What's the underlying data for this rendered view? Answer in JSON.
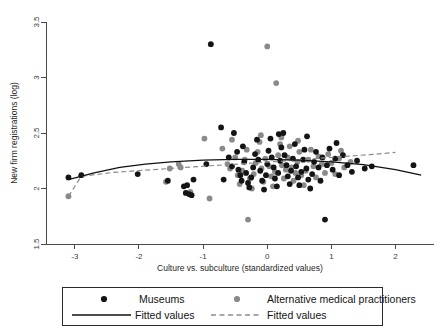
{
  "chart_data": {
    "type": "scatter",
    "title": "",
    "xlabel": "Culture vs. subculture (standardized values)",
    "ylabel": "New firm registrations (log)",
    "xlim": [
      -3.45,
      2.6
    ],
    "ylim": [
      1.5,
      3.5
    ],
    "xticks": [
      -3,
      -2,
      -1,
      0,
      1,
      2
    ],
    "xticklabels": [
      "-3",
      "-2",
      "-1",
      "0",
      "1",
      "2"
    ],
    "yticks": [
      1.5,
      2,
      2.5,
      3,
      3.5
    ],
    "yticklabels": [
      "1.5",
      "2",
      "2.5",
      "3",
      "3.5"
    ],
    "grid": false,
    "legend_position": "below-axes",
    "colors": {
      "museums": "#141414",
      "practitioners": "#8a8a8a",
      "fit_museums": "#111111",
      "fit_practitioners": "#8c8c8c",
      "axis": "#4a4a4a",
      "background": "#ffffff"
    },
    "series": [
      {
        "name": "Museums",
        "marker": "circle",
        "color": "#141414",
        "points": [
          [
            -3.1,
            2.1
          ],
          [
            -2.9,
            2.12
          ],
          [
            -2.02,
            2.13
          ],
          [
            -1.3,
            2.02
          ],
          [
            -1.25,
            2.03
          ],
          [
            -1.27,
            1.96
          ],
          [
            -1.22,
            1.95
          ],
          [
            -1.18,
            1.94
          ],
          [
            -1.15,
            2.08
          ],
          [
            -0.95,
            2.22
          ],
          [
            -0.88,
            3.3
          ],
          [
            -0.72,
            2.55
          ],
          [
            -0.6,
            2.28
          ],
          [
            -0.55,
            2.2
          ],
          [
            -0.52,
            2.5
          ],
          [
            -0.47,
            2.33
          ],
          [
            -0.45,
            2.17
          ],
          [
            -0.42,
            2.12
          ],
          [
            -0.4,
            2.07
          ],
          [
            -0.38,
            2.38
          ],
          [
            -0.36,
            2.24
          ],
          [
            -0.33,
            2.14
          ],
          [
            -0.3,
            2.05
          ],
          [
            -0.28,
            2.01
          ],
          [
            -0.25,
            2.1
          ],
          [
            -0.22,
            2.19
          ],
          [
            -0.19,
            2.31
          ],
          [
            -0.16,
            2.44
          ],
          [
            -0.14,
            2.26
          ],
          [
            -0.11,
            2.16
          ],
          [
            -0.08,
            2.07
          ],
          [
            -0.05,
            1.99
          ],
          [
            -0.02,
            2.12
          ],
          [
            0.0,
            2.22
          ],
          [
            0.02,
            2.34
          ],
          [
            0.05,
            2.45
          ],
          [
            0.07,
            2.28
          ],
          [
            0.1,
            2.19
          ],
          [
            0.12,
            2.09
          ],
          [
            0.15,
            2.02
          ],
          [
            0.17,
            2.14
          ],
          [
            0.2,
            2.25
          ],
          [
            0.22,
            2.37
          ],
          [
            0.25,
            2.5
          ],
          [
            0.27,
            2.3
          ],
          [
            0.3,
            2.21
          ],
          [
            0.32,
            2.11
          ],
          [
            0.35,
            2.04
          ],
          [
            0.37,
            2.16
          ],
          [
            0.4,
            2.27
          ],
          [
            0.43,
            2.4
          ],
          [
            0.45,
            2.2
          ],
          [
            0.48,
            2.1
          ],
          [
            0.5,
            2.03
          ],
          [
            0.53,
            2.15
          ],
          [
            0.56,
            2.26
          ],
          [
            0.58,
            2.35
          ],
          [
            0.61,
            2.18
          ],
          [
            0.64,
            2.08
          ],
          [
            0.67,
            2.0
          ],
          [
            0.7,
            2.13
          ],
          [
            0.73,
            2.24
          ],
          [
            0.76,
            2.33
          ],
          [
            0.8,
            2.19
          ],
          [
            0.83,
            2.07
          ],
          [
            0.86,
            2.28
          ],
          [
            0.9,
            1.72
          ],
          [
            0.93,
            2.21
          ],
          [
            0.97,
            2.36
          ],
          [
            1.02,
            2.17
          ],
          [
            1.06,
            2.27
          ],
          [
            1.12,
            2.12
          ],
          [
            1.18,
            2.3
          ],
          [
            1.25,
            2.21
          ],
          [
            1.32,
            2.15
          ],
          [
            1.4,
            2.25
          ],
          [
            1.52,
            2.18
          ],
          [
            1.63,
            2.2
          ],
          [
            2.28,
            2.21
          ],
          [
            -1.55,
            2.07
          ],
          [
            -0.68,
            2.08
          ],
          [
            0.18,
            2.49
          ],
          [
            0.62,
            2.47
          ],
          [
            1.08,
            2.41
          ]
        ]
      },
      {
        "name": "Alternative medical practitioners",
        "marker": "circle",
        "color": "#8a8a8a",
        "points": [
          [
            -3.1,
            1.93
          ],
          [
            -1.58,
            2.06
          ],
          [
            -1.52,
            2.18
          ],
          [
            -1.38,
            2.22
          ],
          [
            -1.35,
            2.19
          ],
          [
            -1.2,
            1.97
          ],
          [
            -0.98,
            2.45
          ],
          [
            -0.9,
            1.91
          ],
          [
            -0.62,
            2.22
          ],
          [
            -0.58,
            2.18
          ],
          [
            -0.5,
            2.28
          ],
          [
            -0.46,
            2.12
          ],
          [
            -0.43,
            2.04
          ],
          [
            -0.39,
            2.16
          ],
          [
            -0.35,
            2.26
          ],
          [
            -0.32,
            2.35
          ],
          [
            -0.3,
            1.72
          ],
          [
            -0.27,
            2.09
          ],
          [
            -0.24,
            2.0
          ],
          [
            -0.21,
            2.13
          ],
          [
            -0.18,
            2.23
          ],
          [
            -0.15,
            2.33
          ],
          [
            -0.12,
            2.42
          ],
          [
            -0.09,
            2.18
          ],
          [
            -0.06,
            2.06
          ],
          [
            -0.03,
            2.27
          ],
          [
            0.0,
            3.28
          ],
          [
            0.03,
            2.2
          ],
          [
            0.06,
            2.11
          ],
          [
            0.09,
            2.02
          ],
          [
            0.12,
            2.15
          ],
          [
            0.14,
            2.95
          ],
          [
            0.17,
            2.3
          ],
          [
            0.2,
            2.4
          ],
          [
            0.23,
            2.21
          ],
          [
            0.26,
            2.09
          ],
          [
            0.29,
            2.17
          ],
          [
            0.32,
            2.28
          ],
          [
            0.35,
            2.38
          ],
          [
            0.38,
            2.19
          ],
          [
            0.41,
            2.07
          ],
          [
            0.44,
            2.14
          ],
          [
            0.47,
            2.24
          ],
          [
            0.5,
            2.33
          ],
          [
            0.53,
            2.12
          ],
          [
            0.57,
            2.03
          ],
          [
            0.6,
            2.16
          ],
          [
            0.64,
            2.26
          ],
          [
            0.68,
            2.35
          ],
          [
            0.72,
            2.2
          ],
          [
            0.76,
            2.1
          ],
          [
            0.8,
            2.29
          ],
          [
            0.85,
            2.22
          ],
          [
            0.9,
            2.14
          ],
          [
            0.95,
            2.31
          ],
          [
            1.0,
            2.23
          ],
          [
            1.06,
            2.13
          ],
          [
            1.12,
            2.27
          ],
          [
            1.2,
            2.19
          ],
          [
            1.3,
            2.24
          ],
          [
            -0.7,
            2.36
          ],
          [
            -0.55,
            2.44
          ],
          [
            0.22,
            2.46
          ],
          [
            0.48,
            2.43
          ],
          [
            -0.1,
            2.48
          ],
          [
            1.15,
            2.34
          ]
        ]
      }
    ],
    "fits": [
      {
        "name": "Fitted values",
        "series": "Museums",
        "style": "solid",
        "color": "#111111",
        "points": [
          [
            -3.1,
            2.08
          ],
          [
            -2.7,
            2.14
          ],
          [
            -2.3,
            2.19
          ],
          [
            -1.9,
            2.22
          ],
          [
            -1.5,
            2.24
          ],
          [
            -1.0,
            2.255
          ],
          [
            -0.5,
            2.262
          ],
          [
            0.0,
            2.262
          ],
          [
            0.5,
            2.255
          ],
          [
            1.0,
            2.24
          ],
          [
            1.5,
            2.215
          ],
          [
            2.0,
            2.17
          ],
          [
            2.4,
            2.12
          ]
        ]
      },
      {
        "name": "Fitted values",
        "series": "Alternative medical practitioners",
        "style": "dashed",
        "color": "#8c8c8c",
        "points": [
          [
            -3.1,
            1.93
          ],
          [
            -2.9,
            2.11
          ],
          [
            -2.4,
            2.145
          ],
          [
            -1.9,
            2.165
          ],
          [
            -1.4,
            2.185
          ],
          [
            -0.9,
            2.205
          ],
          [
            -0.4,
            2.222
          ],
          [
            0.1,
            2.242
          ],
          [
            0.6,
            2.262
          ],
          [
            1.1,
            2.285
          ],
          [
            1.6,
            2.305
          ],
          [
            2.0,
            2.325
          ]
        ]
      }
    ],
    "legend": [
      {
        "label": "Museums",
        "type": "marker",
        "color": "#141414"
      },
      {
        "label": "Alternative medical practitioners",
        "type": "marker",
        "color": "#8a8a8a"
      },
      {
        "label": "Fitted values",
        "type": "line-solid",
        "color": "#111111"
      },
      {
        "label": "Fitted values",
        "type": "line-dashed",
        "color": "#8c8c8c"
      }
    ]
  }
}
